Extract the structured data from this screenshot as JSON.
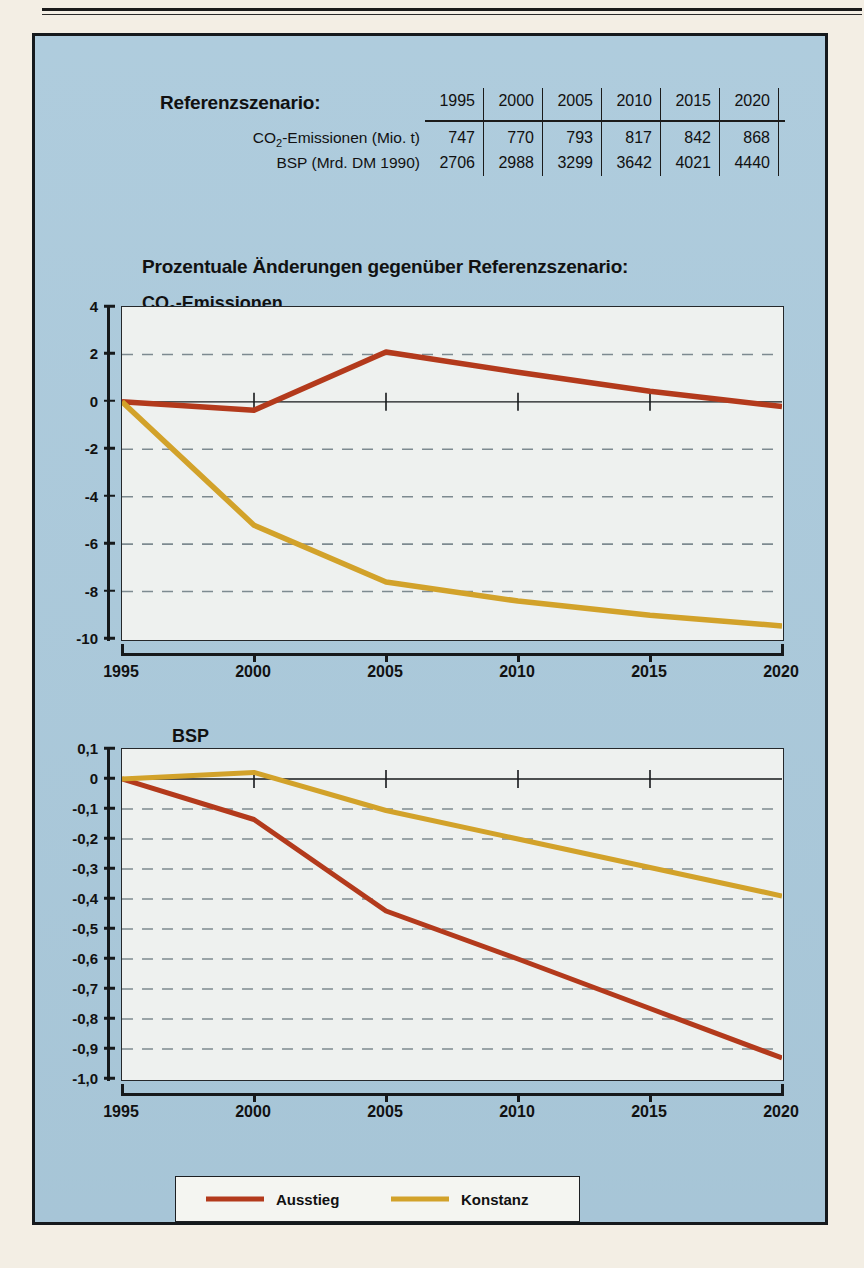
{
  "colors": {
    "page": "#f3eee4",
    "panel": "#aac9db",
    "plot_bg": "#eef1ef",
    "ausstieg": "#b33a1c",
    "konstanz": "#d2a22a",
    "axis": "#16191b",
    "grid": "#7d8a90"
  },
  "reference_table": {
    "title": "Referenzszenario:",
    "row_labels": [
      "CO₂-Emissionen (Mio. t)",
      "BSP (Mrd. DM 1990)"
    ],
    "years": [
      "1995",
      "2000",
      "2005",
      "2010",
      "2015",
      "2020"
    ],
    "co2": [
      "747",
      "770",
      "793",
      "817",
      "842",
      "868"
    ],
    "bsp": [
      "2706",
      "2988",
      "3299",
      "3642",
      "4021",
      "4440"
    ]
  },
  "headings": {
    "section": "Prozentuale Änderungen gegenüber Referenzszenario:",
    "chart1": "CO₂-Emissionen",
    "chart2": "BSP"
  },
  "legend": {
    "items": [
      {
        "label": "Ausstieg",
        "color": "#b33a1c"
      },
      {
        "label": "Konstanz",
        "color": "#d2a22a"
      }
    ]
  },
  "chart_data": [
    {
      "type": "line",
      "title": "CO₂-Emissionen",
      "xlabel": "",
      "ylabel": "",
      "x": [
        1995,
        2000,
        2005,
        2010,
        2015,
        2020
      ],
      "xtick_labels": [
        "1995",
        "2000",
        "2005",
        "2010",
        "2015",
        "2020"
      ],
      "xlim": [
        1995,
        2020
      ],
      "ylim": [
        -10,
        4
      ],
      "ytick_labels": [
        "4",
        "2",
        "0",
        "-2",
        "-4",
        "-6",
        "-8",
        "-10"
      ],
      "yticks": [
        4,
        2,
        0,
        -2,
        -4,
        -6,
        -8,
        -10
      ],
      "grid": true,
      "grid_style": "dashed-horizontal",
      "legend_position": "bottom",
      "series": [
        {
          "name": "Ausstieg",
          "color": "#b33a1c",
          "values": [
            0,
            -0.35,
            2.1,
            1.25,
            0.45,
            -0.2
          ]
        },
        {
          "name": "Konstanz",
          "color": "#d2a22a",
          "values": [
            0,
            -5.2,
            -7.6,
            -8.4,
            -9.0,
            -9.45
          ]
        }
      ]
    },
    {
      "type": "line",
      "title": "BSP",
      "xlabel": "",
      "ylabel": "",
      "x": [
        1995,
        2000,
        2005,
        2010,
        2015,
        2020
      ],
      "xtick_labels": [
        "1995",
        "2000",
        "2005",
        "2010",
        "2015",
        "2020"
      ],
      "xlim": [
        1995,
        2020
      ],
      "ylim": [
        -1.0,
        0.1
      ],
      "ytick_labels": [
        "0,1",
        "0",
        "-0,1",
        "-0,2",
        "-0,3",
        "-0,4",
        "-0,5",
        "-0,6",
        "-0,7",
        "-0,8",
        "-0,9",
        "-1,0"
      ],
      "yticks": [
        0.1,
        0,
        -0.1,
        -0.2,
        -0.3,
        -0.4,
        -0.5,
        -0.6,
        -0.7,
        -0.8,
        -0.9,
        -1.0
      ],
      "grid": true,
      "grid_style": "dashed-horizontal",
      "legend_position": "bottom",
      "series": [
        {
          "name": "Ausstieg",
          "color": "#b33a1c",
          "values": [
            0,
            -0.135,
            -0.44,
            -0.6,
            -0.765,
            -0.93
          ]
        },
        {
          "name": "Konstanz",
          "color": "#d2a22a",
          "values": [
            0,
            0.022,
            -0.105,
            -0.2,
            -0.295,
            -0.39
          ]
        }
      ]
    }
  ]
}
